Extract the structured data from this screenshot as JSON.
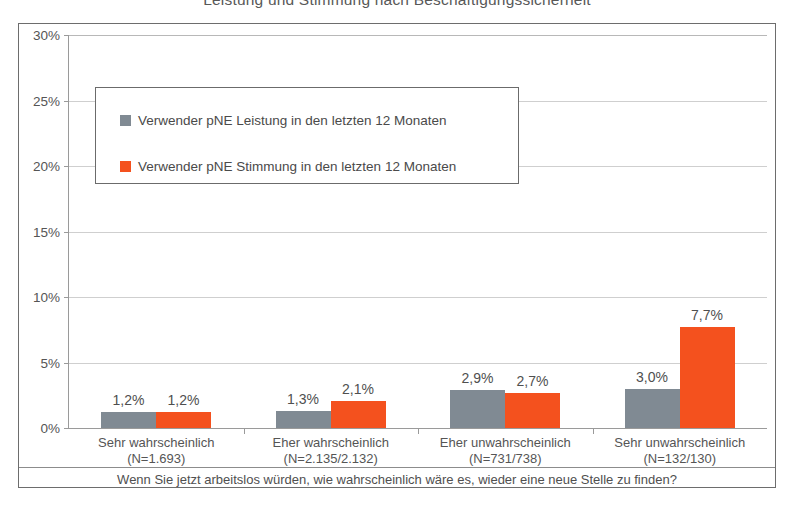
{
  "chart_data": {
    "type": "bar",
    "title": "Leistung und Stimmung nach Beschäftigungssicherheit",
    "xlabel": "",
    "ylabel": "",
    "ylim": [
      0,
      30
    ],
    "grid": true,
    "legend_position": "inside-top-left",
    "value_suffix": "%",
    "categories": [
      "Sehr wahrscheinlich",
      "Eher wahrscheinlich",
      "Eher unwahrscheinlich",
      "Sehr unwahrscheinlich"
    ],
    "category_sublabels": [
      "(N=1.693)",
      "(N=2.135/2.132)",
      "(N=731/738)",
      "(N=132/130)"
    ],
    "ticks": [
      "0%",
      "5%",
      "10%",
      "15%",
      "20%",
      "25%",
      "30%"
    ],
    "tick_values": [
      0,
      5,
      10,
      15,
      20,
      25,
      30
    ],
    "series": [
      {
        "name": "Verwender pNE Leistung in den letzten 12 Monaten",
        "color": "#808A93",
        "values": [
          1.2,
          1.3,
          2.9,
          3.0
        ],
        "labels": [
          "1,2%",
          "1,3%",
          "2,9%",
          "3,0%"
        ]
      },
      {
        "name": "Verwender pNE Stimmung in den letzten 12 Monaten",
        "color": "#F4511E",
        "values": [
          1.2,
          2.1,
          2.7,
          7.7
        ],
        "labels": [
          "1,2%",
          "2,1%",
          "2,7%",
          "7,7%"
        ]
      }
    ],
    "footer_question": "Wenn Sie jetzt arbeitslos würden, wie wahrscheinlich wäre es, wieder eine neue Stelle zu finden?"
  }
}
